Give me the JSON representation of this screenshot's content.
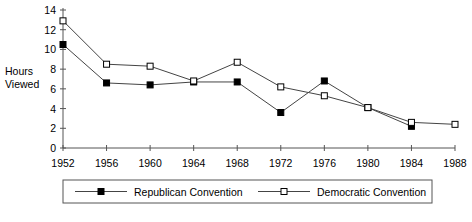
{
  "chart_data": {
    "type": "line",
    "title": "",
    "xlabel": "",
    "ylabel": "Hours Viewed",
    "ylabel_line1": "Hours",
    "ylabel_line2": "Viewed",
    "categories": [
      "1952",
      "1956",
      "1960",
      "1964",
      "1968",
      "1972",
      "1976",
      "1980",
      "1984",
      "1988"
    ],
    "x": [
      1952,
      1956,
      1960,
      1964,
      1968,
      1972,
      1976,
      1980,
      1984,
      1988
    ],
    "xlim": [
      1952,
      1988
    ],
    "ylim": [
      0,
      14
    ],
    "yticks": [
      0,
      2,
      4,
      6,
      8,
      10,
      12,
      14
    ],
    "ytick_labels": [
      "0",
      "2",
      "4",
      "6",
      "8",
      "10",
      "12",
      "14"
    ],
    "grid": false,
    "legend_position": "bottom",
    "series": [
      {
        "name": "Republican Convention",
        "marker": "filled-square",
        "color": "#000000",
        "values": [
          10.5,
          6.6,
          6.4,
          6.7,
          6.7,
          3.6,
          6.8,
          4.1,
          2.2,
          null
        ]
      },
      {
        "name": "Democratic Convention",
        "marker": "open-square",
        "color": "#000000",
        "values": [
          12.9,
          8.5,
          8.3,
          6.8,
          8.7,
          6.2,
          5.3,
          4.1,
          2.6,
          2.4
        ]
      }
    ]
  },
  "legend": {
    "items": [
      {
        "label": "Republican Convention",
        "marker": "filled-square"
      },
      {
        "label": "Democratic Convention",
        "marker": "open-square"
      }
    ]
  }
}
